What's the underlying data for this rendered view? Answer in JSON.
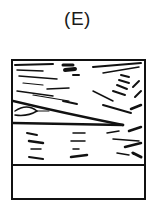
{
  "figure": {
    "panel_label": "(E)",
    "colors": {
      "ink": "#111111",
      "background": "#ffffff"
    }
  }
}
